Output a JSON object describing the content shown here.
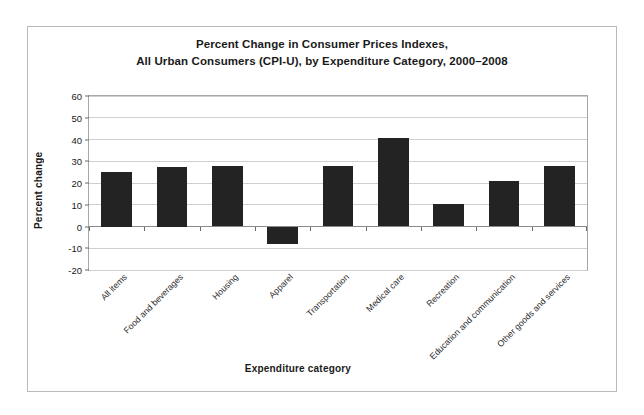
{
  "figure": {
    "title_line1": "Percent Change in Consumer Prices Indexes,",
    "title_line2": "All Urban Consumers (CPI-U), by Expenditure Category, 2000–2008",
    "bar_color": "#232323",
    "frame_color": "#b9b9b9",
    "gridline_color": "#cfcfcf"
  },
  "chart_data": {
    "type": "bar",
    "title": "Percent Change in Consumer Prices Indexes, All Urban Consumers (CPI-U), by Expenditure Category, 2000–2008",
    "xlabel": "Expenditure category",
    "ylabel": "Percent change",
    "ylim": [
      -20,
      60
    ],
    "ytick_step": 10,
    "yticks": [
      60,
      50,
      40,
      30,
      20,
      10,
      0,
      -10,
      -20
    ],
    "ytick_labels": [
      "60",
      "50",
      "40",
      "30",
      "20",
      "10",
      "0",
      "-10",
      "-20"
    ],
    "grid": true,
    "legend": null,
    "categories": [
      "All items",
      "Food and beverages",
      "Housing",
      "Apparel",
      "Transportation",
      "Medical care",
      "Recreation",
      "Education and communication",
      "Other goods and services"
    ],
    "values": [
      25,
      27.5,
      28,
      -8,
      28,
      40.5,
      10.5,
      21,
      28
    ]
  }
}
